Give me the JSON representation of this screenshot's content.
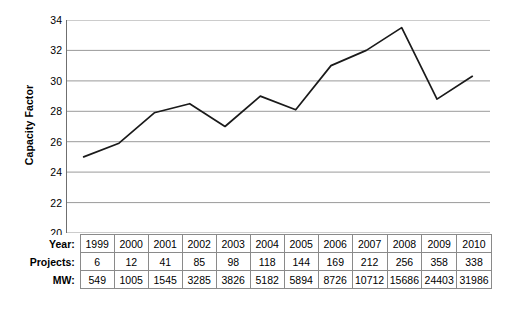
{
  "chart_data": {
    "type": "line",
    "title": "",
    "xlabel": "Year",
    "ylabel": "Capacity Factor",
    "ylim": [
      20,
      34
    ],
    "yticks": [
      20,
      22,
      24,
      26,
      28,
      30,
      32,
      34
    ],
    "grid": true,
    "legend": "none",
    "line_color": "#1a1a1a",
    "grid_color": "#9a9a9a",
    "categories": [
      "1999",
      "2000",
      "2001",
      "2002",
      "2003",
      "2004",
      "2005",
      "2006",
      "2007",
      "2008",
      "2009",
      "2010"
    ],
    "values": [
      25.0,
      25.9,
      27.9,
      28.5,
      27.0,
      29.0,
      28.1,
      31.0,
      32.0,
      33.5,
      28.8,
      30.3
    ],
    "series": [
      {
        "name": "Capacity Factor",
        "values": [
          25.0,
          25.9,
          27.9,
          28.5,
          27.0,
          29.0,
          28.1,
          31.0,
          32.0,
          33.5,
          28.8,
          30.3
        ]
      }
    ]
  },
  "axis": {
    "y_title": "Capacity Factor",
    "y_tick_labels": [
      "34",
      "32",
      "30",
      "28",
      "26",
      "24",
      "22",
      "20"
    ]
  },
  "table": {
    "rows": [
      {
        "label": "Year:",
        "name": "year",
        "cells": [
          "1999",
          "2000",
          "2001",
          "2002",
          "2003",
          "2004",
          "2005",
          "2006",
          "2007",
          "2008",
          "2009",
          "2010"
        ]
      },
      {
        "label": "Projects:",
        "name": "projects",
        "cells": [
          "6",
          "12",
          "41",
          "85",
          "98",
          "118",
          "144",
          "169",
          "212",
          "256",
          "358",
          "338"
        ]
      },
      {
        "label": "MW:",
        "name": "mw",
        "cells": [
          "549",
          "1005",
          "1545",
          "3285",
          "3826",
          "5182",
          "5894",
          "8726",
          "10712",
          "15686",
          "24403",
          "31986"
        ]
      }
    ]
  }
}
